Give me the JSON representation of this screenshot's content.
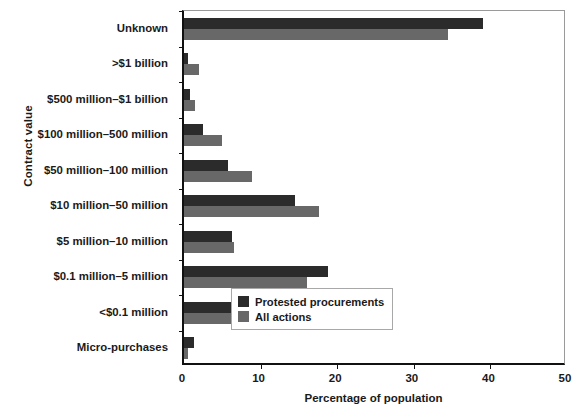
{
  "chart_data": {
    "type": "bar",
    "orientation": "horizontal",
    "title": "",
    "xlabel": "Percentage of population",
    "ylabel": "Contract value",
    "xlim": [
      0,
      50
    ],
    "xticks": [
      0,
      10,
      20,
      30,
      40,
      50
    ],
    "xticklabels": [
      "0",
      "10",
      "20",
      "30",
      "40",
      "50"
    ],
    "grid": false,
    "legend_position": "lower right",
    "categories": [
      "Unknown",
      ">$1 billion",
      "$500 million–$1 billion",
      "$100 million–500 million",
      "$50 million–100 million",
      "$10 million–50 million",
      "$5 million–10 million",
      "$0.1 million–5 million",
      "<$0.1 million",
      "Micro-purchases"
    ],
    "series": [
      {
        "name": "Protested procurements",
        "color": "#2b2b2b",
        "values": [
          39.0,
          0.5,
          0.8,
          2.5,
          5.8,
          14.5,
          6.3,
          18.8,
          9.0,
          1.3
        ]
      },
      {
        "name": "All actions",
        "color": "#686868",
        "values": [
          34.5,
          2.0,
          1.5,
          5.0,
          8.9,
          17.6,
          6.5,
          16.0,
          7.0,
          0.5
        ]
      }
    ]
  },
  "legend": {
    "items": [
      {
        "label": "Protested procurements",
        "swatch": "protested"
      },
      {
        "label": "All actions",
        "swatch": "all"
      }
    ]
  }
}
